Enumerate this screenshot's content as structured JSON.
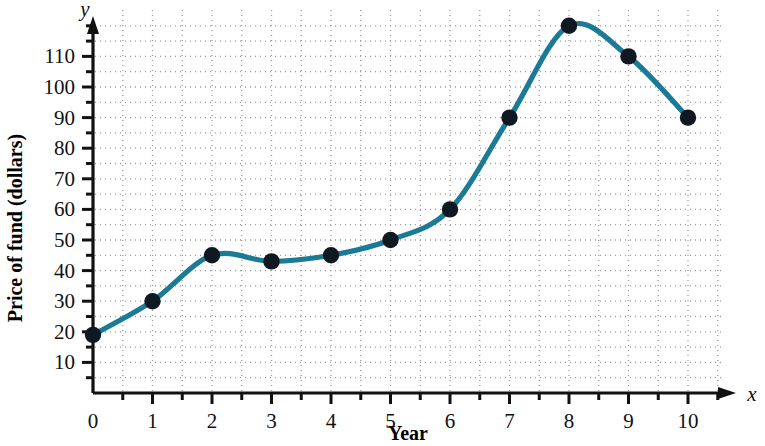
{
  "chart_data": {
    "type": "line",
    "title": "",
    "subtitle": "",
    "xlabel": "Year",
    "ylabel": "Price of fund (dollars)",
    "x_axis_variable": "x",
    "y_axis_variable": "y",
    "x": [
      0,
      1,
      2,
      3,
      4,
      5,
      6,
      7,
      8,
      9,
      10
    ],
    "values": [
      19,
      30,
      45,
      43,
      45,
      50,
      60,
      90,
      120,
      110,
      90
    ],
    "series": [
      {
        "name": "Price of fund",
        "values": [
          19,
          30,
          45,
          43,
          45,
          50,
          60,
          90,
          120,
          110,
          90
        ]
      }
    ],
    "xlim": [
      0,
      10.6
    ],
    "ylim": [
      0,
      126
    ],
    "x_tick_labels": [
      "0",
      "1",
      "2",
      "3",
      "4",
      "5",
      "6",
      "7",
      "8",
      "9",
      "10"
    ],
    "x_ticks": [
      0,
      1,
      2,
      3,
      4,
      5,
      6,
      7,
      8,
      9,
      10
    ],
    "x_minor_ticks": [
      0.5,
      1.5,
      2.5,
      3.5,
      4.5,
      5.5,
      6.5,
      7.5,
      8.5,
      9.5,
      10.5
    ],
    "y_tick_labels": [
      "10",
      "20",
      "30",
      "40",
      "50",
      "60",
      "70",
      "80",
      "90",
      "100",
      "110"
    ],
    "y_ticks": [
      10,
      20,
      30,
      40,
      50,
      60,
      70,
      80,
      90,
      100,
      110
    ],
    "y_minor_ticks": [
      5,
      15,
      25,
      35,
      45,
      55,
      65,
      75,
      85,
      95,
      105,
      115,
      120
    ],
    "grid": true,
    "grid_style": "dotted",
    "grid_color": "#9a9a9a",
    "legend": false,
    "legend_position": "none",
    "line_color": "#1b7a96",
    "marker_color": "#101822",
    "axis_color": "#111111",
    "curve": "smooth",
    "markers": "filled-circle"
  }
}
